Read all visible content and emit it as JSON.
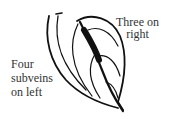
{
  "diagram": {
    "labels": {
      "right": [
        "Three on",
        "right"
      ],
      "left": [
        "Four",
        "subveins",
        "on left"
      ]
    },
    "colors": {
      "ink": "#111111",
      "text": "#333333",
      "background": "#ffffff"
    }
  }
}
